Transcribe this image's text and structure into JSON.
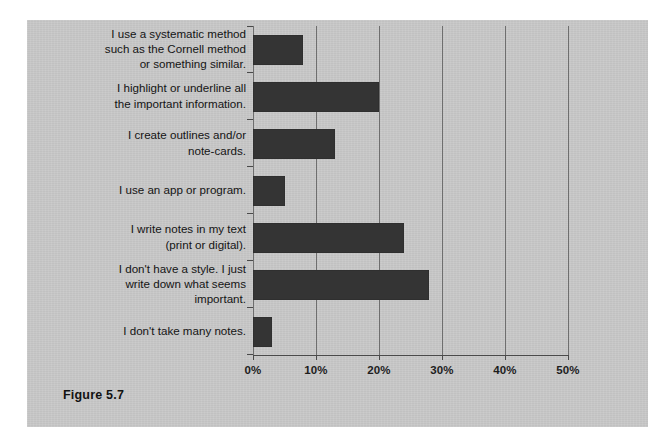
{
  "figure": {
    "caption": "Figure 5.7",
    "panel_color": "#c8c8c8",
    "bar_color": "#343434",
    "grid_color": "#6e6e6e",
    "page_background": "#ffffff"
  },
  "chart_data": {
    "type": "bar",
    "orientation": "horizontal",
    "title": "",
    "subtitle": "",
    "xlabel": "",
    "ylabel": "",
    "xlim": [
      0,
      50
    ],
    "grid": true,
    "legend": null,
    "legend_position": "none",
    "tick_labels": [
      "0%",
      "10%",
      "20%",
      "30%",
      "40%",
      "50%"
    ],
    "tick_values": [
      0,
      10,
      20,
      30,
      40,
      50
    ],
    "value_suffix": "%",
    "categories": [
      "I use a systematic method\nsuch as the Cornell method\nor something similar.",
      "I highlight or underline all\nthe important information.",
      "I create outlines and/or\nnote-cards.",
      "I use an app or program.",
      "I write notes in my text\n(print or digital).",
      "I don't have a style. I just\nwrite down what seems\nimportant.",
      "I don't take many notes."
    ],
    "values": [
      8,
      20,
      13,
      5,
      24,
      28,
      3
    ]
  }
}
